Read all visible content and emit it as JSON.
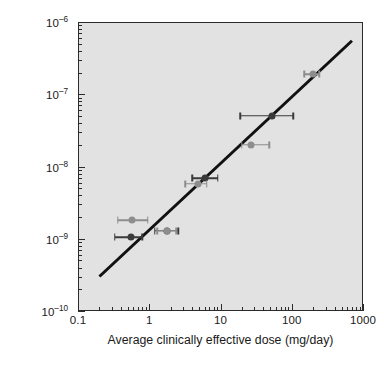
{
  "chart_data": {
    "type": "scatter",
    "title": "",
    "xlabel": "Average clinically effective dose (mg/day)",
    "ylabel_line1": "Concentration required",
    "ylabel_line2": "to block D₂ receptors (M)",
    "xscale": "log",
    "yscale": "log",
    "xlim": [
      0.1,
      1000
    ],
    "ylim": [
      1e-10,
      1e-06
    ],
    "grid": false,
    "legend": null,
    "plot_background": "#e2e2e2",
    "xticks": [
      {
        "value": 0.1,
        "label": "0.1"
      },
      {
        "value": 1,
        "label": "1"
      },
      {
        "value": 10,
        "label": "10"
      },
      {
        "value": 100,
        "label": "100"
      },
      {
        "value": 1000,
        "label": "1000"
      }
    ],
    "yticks": [
      {
        "value": 1e-06,
        "mantissa": "10",
        "exponent": "–6"
      },
      {
        "value": 1e-07,
        "mantissa": "10",
        "exponent": "–7"
      },
      {
        "value": 1e-08,
        "mantissa": "10",
        "exponent": "–8"
      },
      {
        "value": 1e-09,
        "mantissa": "10",
        "exponent": "–9"
      },
      {
        "value": 1e-10,
        "mantissa": "10",
        "exponent": "–10"
      }
    ],
    "fit_line": {
      "style": "solid",
      "color": "#111111",
      "width_px": 3,
      "x_start": 0.2,
      "y_start": 3e-10,
      "x_end": 700,
      "y_end": 5.5e-07
    },
    "series": [
      {
        "name": "dark points",
        "color": "#3a3a3a",
        "marker": "circle",
        "points": [
          {
            "x": 0.55,
            "y": 1.05e-09,
            "xerr_low": 0.33,
            "xerr_high": 0.8
          },
          {
            "x": 1.75,
            "y": 1.3e-09,
            "xerr_low": 1.2,
            "xerr_high": 2.55
          },
          {
            "x": 6.0,
            "y": 6.9e-09,
            "xerr_low": 4.0,
            "xerr_high": 9.2
          },
          {
            "x": 52,
            "y": 5e-08,
            "xerr_low": 19,
            "xerr_high": 105
          }
        ]
      },
      {
        "name": "gray points",
        "color": "#8d8d8d",
        "marker": "circle",
        "points": [
          {
            "x": 0.58,
            "y": 1.8e-09,
            "xerr_low": 0.36,
            "xerr_high": 0.95
          },
          {
            "x": 1.75,
            "y": 1.3e-09,
            "xerr_low": 1.3,
            "xerr_high": 2.4
          },
          {
            "x": 4.8,
            "y": 5.8e-09,
            "xerr_low": 3.2,
            "xerr_high": 6.4
          },
          {
            "x": 27,
            "y": 2e-08,
            "xerr_low": 20,
            "xerr_high": 48
          },
          {
            "x": 200,
            "y": 1.9e-07,
            "xerr_low": 150,
            "xerr_high": 245
          }
        ]
      }
    ]
  }
}
